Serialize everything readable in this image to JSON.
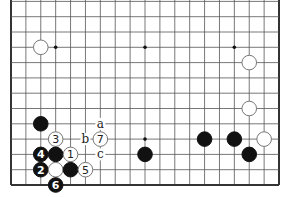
{
  "diagram": {
    "type": "go-board-partial",
    "board_size": 19,
    "visible_rows_from_bottom": 13,
    "colors": {
      "background": "#ffffff",
      "line": "#555555",
      "edge": "#333333",
      "black": "#111111",
      "white_fill": "#ffffff",
      "white_stroke": "#777777"
    },
    "star_points": [
      [
        4,
        10
      ],
      [
        10,
        10
      ],
      [
        16,
        10
      ],
      [
        4,
        4
      ],
      [
        10,
        4
      ],
      [
        16,
        4
      ]
    ],
    "stones": [
      {
        "color": "white",
        "col": 3,
        "row": 10,
        "label": ""
      },
      {
        "color": "white",
        "col": 17,
        "row": 9,
        "label": ""
      },
      {
        "color": "white",
        "col": 17,
        "row": 6,
        "label": ""
      },
      {
        "color": "white",
        "col": 18,
        "row": 4,
        "label": ""
      },
      {
        "color": "black",
        "col": 14,
        "row": 4,
        "label": ""
      },
      {
        "color": "black",
        "col": 16,
        "row": 4,
        "label": ""
      },
      {
        "color": "black",
        "col": 17,
        "row": 3,
        "label": ""
      },
      {
        "color": "black",
        "col": 10,
        "row": 3,
        "label": ""
      },
      {
        "color": "black",
        "col": 3,
        "row": 5,
        "label": ""
      },
      {
        "color": "white",
        "col": 4,
        "row": 4,
        "label": "3"
      },
      {
        "color": "white",
        "col": 7,
        "row": 4,
        "label": "7"
      },
      {
        "color": "black",
        "col": 3,
        "row": 3,
        "label": "4"
      },
      {
        "color": "black",
        "col": 4,
        "row": 3,
        "label": ""
      },
      {
        "color": "white",
        "col": 5,
        "row": 3,
        "label": "1"
      },
      {
        "color": "black",
        "col": 3,
        "row": 2,
        "label": "2"
      },
      {
        "color": "white",
        "col": 4,
        "row": 2,
        "label": ""
      },
      {
        "color": "black",
        "col": 5,
        "row": 2,
        "label": ""
      },
      {
        "color": "white",
        "col": 6,
        "row": 2,
        "label": "5"
      },
      {
        "color": "black",
        "col": 4,
        "row": 1,
        "label": "6"
      }
    ],
    "letters": [
      {
        "text": "a",
        "col": 7,
        "row": 5
      },
      {
        "text": "b",
        "col": 6,
        "row": 4
      },
      {
        "text": "c",
        "col": 7,
        "row": 3
      }
    ]
  }
}
